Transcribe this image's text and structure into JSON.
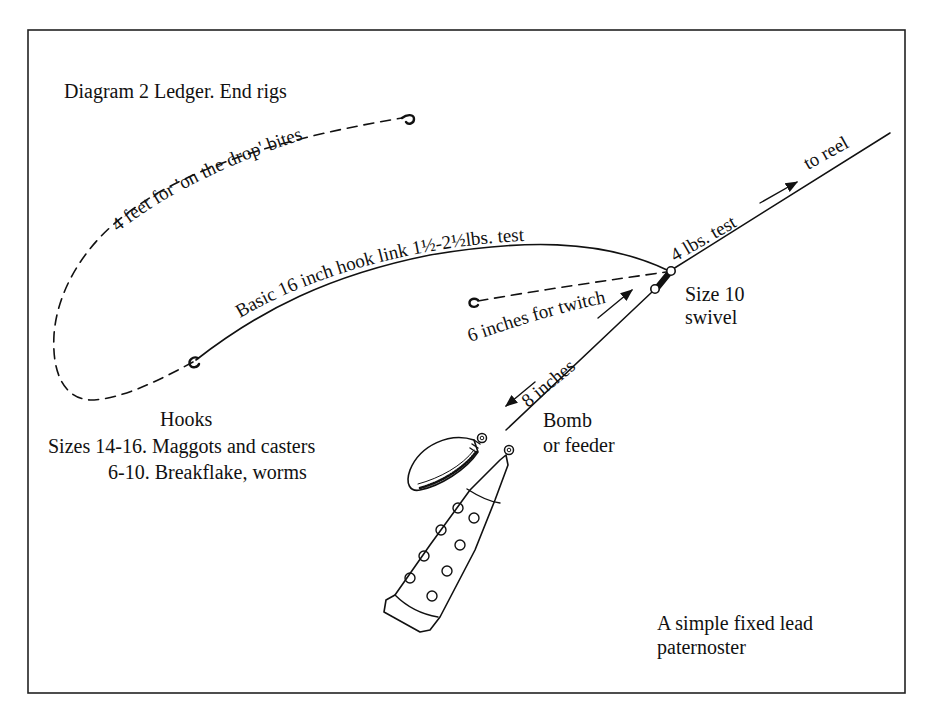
{
  "diagram": {
    "title": "Diagram 2 Ledger. End rigs",
    "caption_line1": "A simple fixed lead",
    "caption_line2": "paternoster",
    "colors": {
      "ink": "#111111",
      "background": "#ffffff"
    },
    "lines": {
      "drop_link": "4 feet for 'on the drop' bites",
      "hook_link": "Basic 16 inch hook link 1½-2½lbs. test",
      "twitcher_link": "6 inches for twitchers",
      "lead_link": "8 inches",
      "main_line": "4 lbs. test",
      "to_reel": "to reel"
    },
    "swivel": {
      "line1": "Size 10",
      "line2": "swivel"
    },
    "weight": {
      "line1": "Bomb",
      "line2": "or feeder"
    },
    "hooks": {
      "heading": "Hooks",
      "line1": "Sizes 14-16. Maggots and casters",
      "line2": "6-10. Breakflake, worms"
    },
    "icons": [
      "hook-icon",
      "swivel-icon",
      "bomb-weight-icon",
      "feeder-icon",
      "arrow-icon"
    ]
  }
}
